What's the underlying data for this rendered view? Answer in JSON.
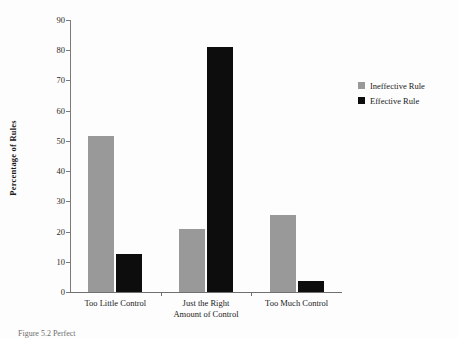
{
  "chart_data": {
    "type": "bar",
    "title": "",
    "xlabel": "",
    "ylabel": "Percentage of Rules",
    "ylim": [
      0,
      90
    ],
    "ytick_step": 10,
    "yticks": [
      90,
      80,
      70,
      60,
      50,
      40,
      30,
      20,
      10,
      0
    ],
    "grid": false,
    "legend_position": "right",
    "categories": [
      "Too Little Control",
      "Just the Right\nAmount of Control",
      "Too Much Control"
    ],
    "category_lines": [
      [
        "Too Little Control"
      ],
      [
        "Just the Right",
        "Amount of Control"
      ],
      [
        "Too Much Control"
      ]
    ],
    "series": [
      {
        "name": "Ineffective Rule",
        "color": "#999999",
        "values": [
          51.5,
          21.0,
          25.5
        ]
      },
      {
        "name": "Effective Rule",
        "color": "#0d0d0d",
        "values": [
          12.5,
          81.0,
          3.5
        ]
      }
    ]
  },
  "legend": {
    "items": [
      {
        "label": "Ineffective Rule",
        "color": "#999999"
      },
      {
        "label": "Effective Rule",
        "color": "#0d0d0d"
      }
    ]
  },
  "caption": {
    "text": "Figure 5.2  Perfect"
  }
}
